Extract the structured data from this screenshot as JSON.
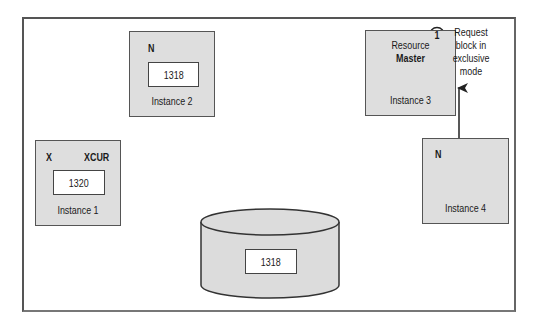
{
  "diagram": {
    "instances": [
      {
        "id": "instance-1",
        "label": "Instance 1",
        "lock_mode": "X",
        "block_state": "XCUR",
        "block_value": "1320"
      },
      {
        "id": "instance-2",
        "label": "Instance 2",
        "lock_mode": "N",
        "block_value": "1318"
      },
      {
        "id": "instance-3",
        "label": "Instance 3",
        "role": "Resource Master",
        "role_line1": "Resource",
        "role_line2": "Master"
      },
      {
        "id": "instance-4",
        "label": "Instance 4",
        "lock_mode": "N"
      }
    ],
    "disk": {
      "block_value": "1318"
    },
    "step": {
      "number": "1",
      "text_lines": [
        "Request",
        "block in",
        "exclusive",
        "mode"
      ],
      "from": "Instance 4",
      "to": "Instance 3"
    },
    "colors": {
      "box_fill": "#dedede",
      "border": "#555555",
      "background": "#ffffff"
    }
  }
}
